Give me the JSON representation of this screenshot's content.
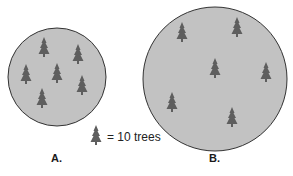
{
  "diagram": {
    "colors": {
      "circle_fill": "#c2c2c2",
      "circle_stroke": "#333333",
      "tree": "#5e5e5e"
    },
    "plots": [
      {
        "label": "A.",
        "cx": 57,
        "cy": 77,
        "r": 49,
        "trees": [
          [
            44,
            49
          ],
          [
            78,
            56
          ],
          [
            26,
            76
          ],
          [
            57,
            75
          ],
          [
            82,
            87
          ],
          [
            42,
            100
          ]
        ]
      },
      {
        "label": "B.",
        "cx": 215,
        "cy": 79,
        "r": 72,
        "trees": [
          [
            182,
            34
          ],
          [
            237,
            29
          ],
          [
            215,
            70
          ],
          [
            266,
            74
          ],
          [
            172,
            104
          ],
          [
            232,
            119
          ]
        ]
      }
    ],
    "legend": {
      "text": "= 10 trees",
      "icon": "tree-icon",
      "icon_x": 96,
      "icon_y": 137
    }
  }
}
